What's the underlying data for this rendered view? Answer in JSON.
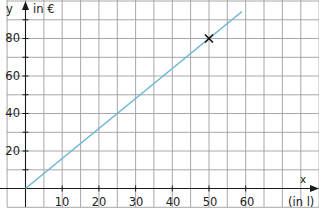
{
  "chart_data": {
    "type": "line",
    "title": "",
    "xlabel": "(in l)",
    "ylabel": "in €",
    "x_axis_name": "x",
    "y_axis_name": "y",
    "x_ticks": [
      10,
      20,
      30,
      40,
      50,
      60
    ],
    "y_ticks": [
      20,
      40,
      60,
      80
    ],
    "xlim": [
      -5,
      78
    ],
    "ylim": [
      -10,
      100
    ],
    "grid": true,
    "grid_step": {
      "x": 5,
      "y": 10
    },
    "legend": null,
    "series": [
      {
        "name": "line",
        "color": "#6db7d8",
        "x": [
          0,
          59
        ],
        "y": [
          0,
          94.4
        ],
        "relation": "y = 1.6x"
      }
    ],
    "annotations": [
      {
        "type": "point-marker",
        "symbol": "×",
        "x": 50,
        "y": 80,
        "color": "#111111"
      }
    ]
  },
  "labels": {
    "y_name": "y",
    "y_unit": "in €",
    "x_name": "x",
    "x_unit": "(in l)",
    "x_tick_labels": [
      "10",
      "20",
      "30",
      "40",
      "50",
      "60"
    ],
    "y_tick_labels": [
      "20",
      "40",
      "60",
      "80"
    ]
  }
}
